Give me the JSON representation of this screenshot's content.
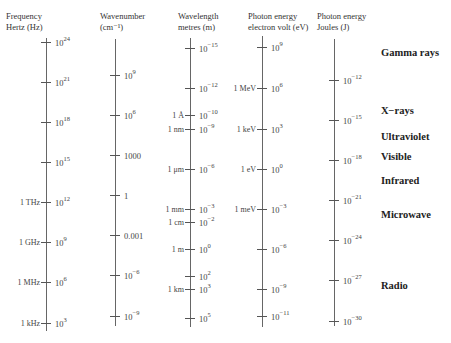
{
  "columns": [
    {
      "id": "frequency",
      "header": [
        "Frequency",
        "Hertz (Hz)"
      ],
      "axis_x": 46,
      "axis_top": 38,
      "axis_bottom": 331,
      "hdr_x": 6,
      "hdr_y": 11,
      "ticks": [
        {
          "y": 42,
          "base": "10",
          "exp": "24"
        },
        {
          "y": 82,
          "base": "10",
          "exp": "21"
        },
        {
          "y": 122,
          "base": "10",
          "exp": "18"
        },
        {
          "y": 162,
          "base": "10",
          "exp": "15"
        },
        {
          "y": 202,
          "base": "10",
          "exp": "12",
          "unit": "1 THz"
        },
        {
          "y": 242,
          "base": "10",
          "exp": "9",
          "unit": "1 GHz"
        },
        {
          "y": 282,
          "base": "10",
          "exp": "6",
          "unit": "1 MHz"
        },
        {
          "y": 323,
          "base": "10",
          "exp": "3",
          "unit": "1 kHz"
        }
      ]
    },
    {
      "id": "wavenumber",
      "header": [
        "Wavenumber",
        "(cm⁻¹)"
      ],
      "axis_x": 115,
      "axis_top": 39,
      "axis_bottom": 326,
      "hdr_x": 100,
      "hdr_y": 11,
      "ticks": [
        {
          "y": 75,
          "base": "10",
          "exp": "9"
        },
        {
          "y": 115,
          "base": "10",
          "exp": "6"
        },
        {
          "y": 155,
          "base": "1000",
          "exp": ""
        },
        {
          "y": 195,
          "base": "1",
          "exp": ""
        },
        {
          "y": 235,
          "base": "0.001",
          "exp": ""
        },
        {
          "y": 275,
          "base": "10",
          "exp": "−6"
        },
        {
          "y": 316,
          "base": "10",
          "exp": "−9"
        }
      ]
    },
    {
      "id": "wavelength",
      "header": [
        "Wavelength",
        "metres (m)"
      ],
      "axis_x": 190,
      "axis_top": 38,
      "axis_bottom": 327,
      "hdr_x": 178,
      "hdr_y": 11,
      "ticks": [
        {
          "y": 48,
          "base": "10",
          "exp": "−15"
        },
        {
          "y": 88,
          "base": "10",
          "exp": "−12"
        },
        {
          "y": 115,
          "base": "10",
          "exp": "−10",
          "unit": "1 Å"
        },
        {
          "y": 129,
          "base": "10",
          "exp": "−9",
          "unit": "1 nm"
        },
        {
          "y": 169,
          "base": "10",
          "exp": "−6",
          "unit": "1 μm"
        },
        {
          "y": 209,
          "base": "10",
          "exp": "−3",
          "unit": "1 mm"
        },
        {
          "y": 222,
          "base": "10",
          "exp": "−2",
          "unit": "1 cm"
        },
        {
          "y": 249,
          "base": "10",
          "exp": "0",
          "unit": "1 m"
        },
        {
          "y": 276,
          "base": "10",
          "exp": "2"
        },
        {
          "y": 289,
          "base": "10",
          "exp": "3",
          "unit": "1 km"
        },
        {
          "y": 318,
          "base": "10",
          "exp": "5"
        }
      ]
    },
    {
      "id": "photon-energy-ev",
      "header": [
        "Photon energy",
        "electron volt (eV)"
      ],
      "axis_x": 262,
      "axis_top": 36,
      "axis_bottom": 327,
      "hdr_x": 248,
      "hdr_y": 11,
      "ticks": [
        {
          "y": 47,
          "base": "10",
          "exp": "9"
        },
        {
          "y": 88,
          "base": "10",
          "exp": "6",
          "unit": "1 MeV"
        },
        {
          "y": 129,
          "base": "10",
          "exp": "3",
          "unit": "1 keV"
        },
        {
          "y": 169,
          "base": "10",
          "exp": "0",
          "unit": "1 eV"
        },
        {
          "y": 209,
          "base": "10",
          "exp": "−3",
          "unit": "1 meV"
        },
        {
          "y": 249,
          "base": "10",
          "exp": "−6"
        },
        {
          "y": 289,
          "base": "10",
          "exp": "−9"
        },
        {
          "y": 316,
          "base": "10",
          "exp": "−11"
        }
      ]
    },
    {
      "id": "photon-energy-joules",
      "header": [
        "Photon energy",
        "Joules (J)"
      ],
      "axis_x": 334,
      "axis_top": 39,
      "axis_bottom": 326,
      "hdr_x": 317,
      "hdr_y": 11,
      "ticks": [
        {
          "y": 80,
          "base": "10",
          "exp": "−12"
        },
        {
          "y": 120,
          "base": "10",
          "exp": "−15"
        },
        {
          "y": 160,
          "base": "10",
          "exp": "−18"
        },
        {
          "y": 200,
          "base": "10",
          "exp": "−21"
        },
        {
          "y": 240,
          "base": "10",
          "exp": "−24"
        },
        {
          "y": 280,
          "base": "10",
          "exp": "−27"
        },
        {
          "y": 321,
          "base": "10",
          "exp": "−30"
        }
      ]
    }
  ],
  "regions": [
    {
      "label": "Gamma rays",
      "y": 54
    },
    {
      "label": "X−rays",
      "y": 112
    },
    {
      "label": "Ultraviolet",
      "y": 138
    },
    {
      "label": "Visible",
      "y": 158
    },
    {
      "label": "Infrared",
      "y": 182
    },
    {
      "label": "Microwave",
      "y": 216
    },
    {
      "label": "Radio",
      "y": 287
    }
  ],
  "regions_x": 381
}
